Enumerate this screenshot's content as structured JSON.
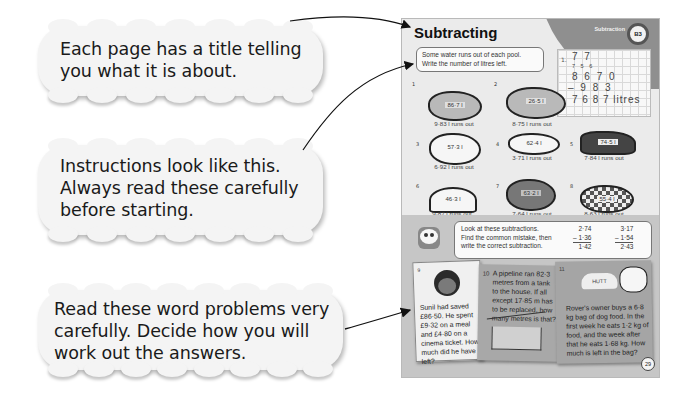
{
  "callouts": [
    {
      "id": "title-callout",
      "text_lines": [
        "Each page has a title telling",
        "you what it is about."
      ]
    },
    {
      "id": "instructions-callout",
      "text_lines": [
        "Instructions look like this.",
        "Always read these carefully",
        "before starting."
      ]
    },
    {
      "id": "word-problems-callout",
      "text_lines": [
        "Read these word problems very",
        "carefully. Decide how you will",
        "work out the answers."
      ]
    }
  ],
  "page": {
    "title": "Subtracting",
    "section_label": "Subtraction",
    "unit_number": "B3",
    "page_number": "29",
    "instruction_1": [
      "Some water runs out of each pool.",
      "Write the number of litres left."
    ],
    "worked_example": {
      "label": "1.",
      "carry_top": "7 7",
      "crossed": "7 5 6",
      "minuend": "8 6 7 0",
      "subtrahend": "– 9 8 3",
      "answer": "7 6 8 7 litres"
    },
    "pools": [
      {
        "num": "1",
        "capacity": "86·7 l",
        "runs_out": "9·83 l runs out"
      },
      {
        "num": "2",
        "capacity": "26·5 l",
        "runs_out": "8·75 l runs out"
      },
      {
        "num": "3",
        "capacity": "57·3 l",
        "runs_out": "6·92 l runs out"
      },
      {
        "num": "4",
        "capacity": "62·4 l",
        "runs_out": "3·71 l runs out"
      },
      {
        "num": "5",
        "capacity": "74·5 l",
        "runs_out": "7·84 l runs out"
      },
      {
        "num": "6",
        "capacity": "46·3 l",
        "runs_out": "9·87 l runs out"
      },
      {
        "num": "7",
        "capacity": "63·2 l",
        "runs_out": "7·64 l runs out"
      },
      {
        "num": "8",
        "capacity": "55·4 l",
        "runs_out": "8·63 l runs out"
      }
    ],
    "instruction_2": [
      "Look at these subtractions.",
      "Find the common mistake, then",
      "write the correct subtraction."
    ],
    "mistake_sums": [
      {
        "top": "2·74",
        "bottom": "– 1·36",
        "result": "1·42"
      },
      {
        "top": "3·17",
        "bottom": "– 1·54",
        "result": "2·43"
      }
    ],
    "word_problems": [
      {
        "num": "9",
        "text": "Sunil had saved £86·50. He spent £9·32 on a meal and £4·80 on a cinema ticket. How much did he have left?"
      },
      {
        "num": "10",
        "text": "A pipeline ran 82·3 metres from a tank to the house. If all except 17·85 m has to be replaced, how many metres is that?"
      },
      {
        "num": "11",
        "text": "Rover's owner buys a 6·8 kg bag of dog food. In the first week he eats 1·2 kg of food, and the week after that he eats 1·68 kg. How much is left in the bag?",
        "hut_label": "HUTT"
      }
    ]
  },
  "colors": {
    "page_upper_bg": "#ebebeb",
    "page_lower_bg": "#c6c6c6",
    "cloud_bg": "#f4f4f4",
    "corner_band": "#8f8f8f"
  }
}
